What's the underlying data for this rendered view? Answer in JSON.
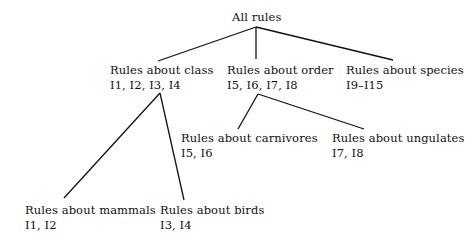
{
  "diagram": {
    "type": "tree",
    "root": {
      "label": "All rules",
      "children": [
        "class",
        "order",
        "species"
      ]
    },
    "nodes": {
      "class": {
        "label": "Rules about class",
        "ids": "I1, I2, I3, I4"
      },
      "order": {
        "label": "Rules about order",
        "ids": "I5, I6, I7, I8"
      },
      "species": {
        "label": "Rules about species",
        "ids": "I9–I15"
      },
      "carnivores": {
        "label": "Rules about carnivores",
        "ids": "I5, I6"
      },
      "ungulates": {
        "label": "Rules about ungulates",
        "ids": "I7, I8"
      },
      "mammals": {
        "label": "Rules about mammals",
        "ids": "I1, I2"
      },
      "birds": {
        "label": "Rules about birds",
        "ids": "I3, I4"
      }
    },
    "edges": [
      {
        "from": "root",
        "to": "class"
      },
      {
        "from": "root",
        "to": "order"
      },
      {
        "from": "root",
        "to": "species"
      },
      {
        "from": "class",
        "to": "mammals"
      },
      {
        "from": "class",
        "to": "birds"
      },
      {
        "from": "order",
        "to": "carnivores"
      },
      {
        "from": "order",
        "to": "ungulates"
      }
    ],
    "line_color": "#111111"
  }
}
